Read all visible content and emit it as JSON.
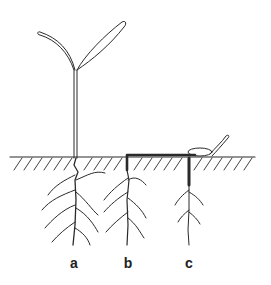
{
  "diagram": {
    "title": "",
    "labels": [
      {
        "id": "a",
        "text": "a",
        "x": 74,
        "y": 255
      },
      {
        "id": "b",
        "text": "b",
        "x": 128,
        "y": 255
      },
      {
        "id": "c",
        "text": "c",
        "x": 189,
        "y": 255
      }
    ],
    "ground_y": 157,
    "colors": {
      "ink": "#2a2a2a",
      "background": "#ffffff"
    }
  }
}
